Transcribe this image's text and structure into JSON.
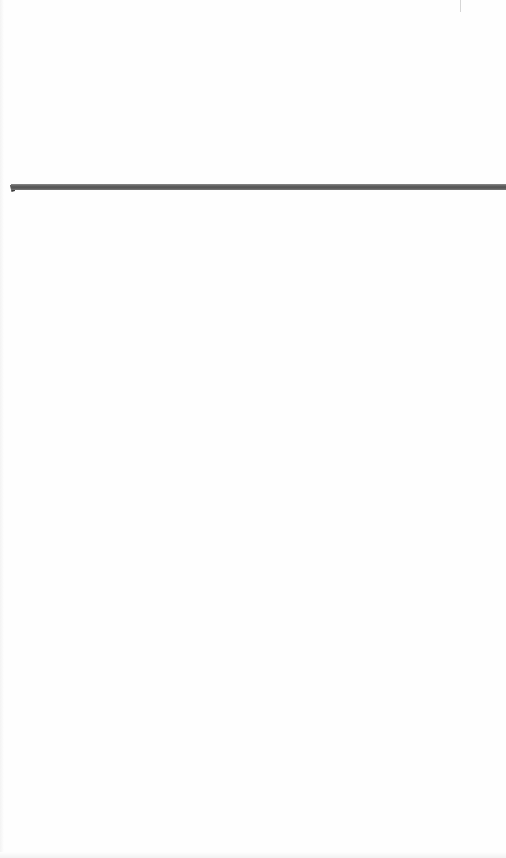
{
  "document": {
    "background_color": "#fefefe",
    "content_text": "",
    "elements": [
      {
        "type": "horizontal-rule",
        "color": "#5c5c5c",
        "position": {
          "x": 11,
          "y": 184,
          "width": 495,
          "height": 6
        }
      }
    ]
  }
}
